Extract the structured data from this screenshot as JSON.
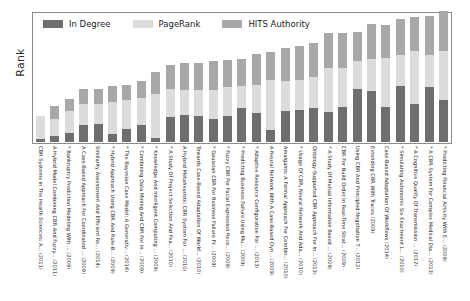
{
  "chart_data": {
    "type": "bar",
    "subtype": "stacked-bar",
    "title": "",
    "xlabel": "",
    "ylabel": "Rank",
    "grid": false,
    "legend_position": "top-left",
    "orientation": "vertical",
    "stacked": true,
    "ylim": [
      0,
      100
    ],
    "y_ticks": [],
    "colors": {
      "in_degree": "#6e6e6e",
      "pagerank": "#dcdcdc",
      "hits_authority": "#a8a8a8",
      "frame": "#8a8a8a",
      "text": "#1d1d1d",
      "background": "#ffffff"
    },
    "series": [
      {
        "name": "In Degree",
        "color": "#6e6e6e",
        "values": [
          2,
          5,
          7,
          13,
          14,
          6,
          10,
          13,
          3,
          19,
          21,
          20,
          18,
          20,
          26,
          22,
          9,
          24,
          25,
          26,
          23,
          27,
          41,
          39,
          27,
          43,
          29,
          42,
          32
        ]
      },
      {
        "name": "PageRank",
        "color": "#dcdcdc",
        "values": [
          18,
          13,
          17,
          16,
          15,
          25,
          22,
          21,
          34,
          22,
          19,
          20,
          22,
          22,
          17,
          22,
          39,
          23,
          23,
          24,
          34,
          30,
          21,
          25,
          38,
          24,
          41,
          25,
          38
        ]
      },
      {
        "name": "HITS Authority",
        "color": "#a8a8a8",
        "values": [
          0,
          10,
          9,
          12,
          12,
          12,
          12,
          13,
          17,
          18,
          21,
          21,
          22,
          21,
          21,
          24,
          21,
          25,
          26,
          26,
          27,
          27,
          23,
          27,
          25,
          28,
          26,
          30,
          31
        ]
      }
    ],
    "categories": [
      "CBR Systems In The Health Sciences: A... (2011)",
      "A Hybrid Model Combining CBR And Fuzzy... (2011)",
      "* Bankruptcy Prediction Modeling With ... (2009)",
      "A Case-Based Approach For Coordinated ... (2009)",
      "Similarity Assessment And Efficient Re... (2014)",
      "* Hybrid Approach Using CBR And Rule-B... (2009)",
      "* The Bayesian Case Model: A Generativ... (2014)",
      "* Combining Data Mining And CBR For In... (2009)",
      "* Knowledge And Intelligent Computing ... (2009)",
      "* A Study Of Project Selection And Fea... (2010)",
      "A Hybrid Metaheuristic CBR System For ... (2010)",
      "Towards Case-Based Adaptation Of Workf... (2010)",
      "* Gaussian CBR For Business Failure Pr... (2009)",
      "* Fuzzy CBR For Facial Expression Reco... (2009)",
      "* Predicting Business Failure Using Mu... (2009)",
      "* Adaptive Resource Configuration For ... (2013)",
      "A Neural Network With A Case-Based Dyn... (2009)",
      "Amalgams: A Formal Approach For Combin... (2010)",
      "* Usage Of CBR, Neural Network And Ada... (2010)",
      "Ontology-Supported CBR Approach For In... (2013)",
      "* A Study Of Mutual Information Based ... (2009)",
      "CBR For Build Order In Real-Time Strat... (2009)",
      "Using CBR And Principled Negotiation T... (2012)",
      "Extending CBR With Traces (2009)",
      "Case-Based Adaptation Of Workflows (2014)",
      "* Simulating Autonomic Six Enactment L... (2010)",
      "* A Cognitive Quality Of Transmission ... (2012)",
      "* A CBR System For Complex Medical Dia... (2013)",
      "* Predicting Financial Activity With E... (2009)"
    ]
  },
  "legend": {
    "items": [
      {
        "label": "In Degree",
        "color": "#6e6e6e"
      },
      {
        "label": "PageRank",
        "color": "#dcdcdc"
      },
      {
        "label": "HITS Authority",
        "color": "#a8a8a8"
      }
    ]
  },
  "axes": {
    "y_title": "Rank"
  }
}
